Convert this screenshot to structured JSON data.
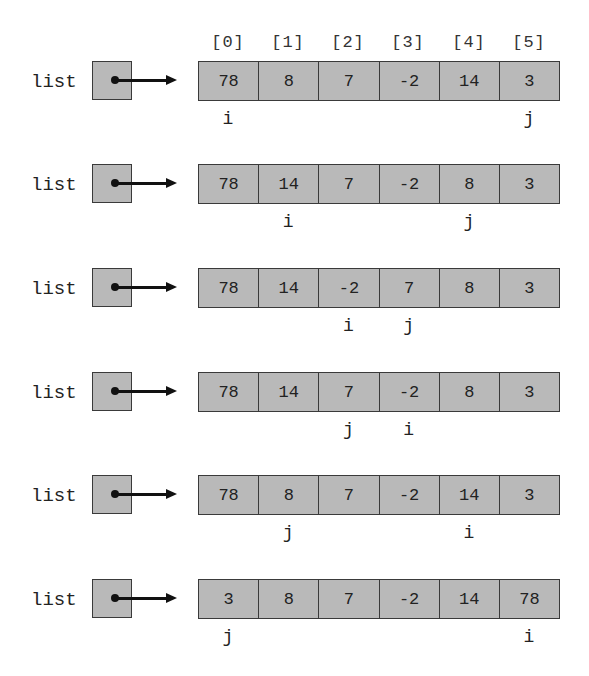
{
  "index_labels": [
    "[0]",
    "[1]",
    "[2]",
    "[3]",
    "[4]",
    "[5]"
  ],
  "variable_name": "list",
  "rows": [
    {
      "cells": [
        "78",
        "8",
        "7",
        "-2",
        "14",
        "3"
      ],
      "markers": [
        {
          "label": "i",
          "index": 0
        },
        {
          "label": "j",
          "index": 5
        }
      ]
    },
    {
      "cells": [
        "78",
        "14",
        "7",
        "-2",
        "8",
        "3"
      ],
      "markers": [
        {
          "label": "i",
          "index": 1
        },
        {
          "label": "j",
          "index": 4
        }
      ]
    },
    {
      "cells": [
        "78",
        "14",
        "-2",
        "7",
        "8",
        "3"
      ],
      "markers": [
        {
          "label": "i",
          "index": 2
        },
        {
          "label": "j",
          "index": 3
        }
      ]
    },
    {
      "cells": [
        "78",
        "14",
        "7",
        "-2",
        "8",
        "3"
      ],
      "markers": [
        {
          "label": "j",
          "index": 2
        },
        {
          "label": "i",
          "index": 3
        }
      ]
    },
    {
      "cells": [
        "78",
        "8",
        "7",
        "-2",
        "14",
        "3"
      ],
      "markers": [
        {
          "label": "j",
          "index": 1
        },
        {
          "label": "i",
          "index": 4
        }
      ]
    },
    {
      "cells": [
        "3",
        "8",
        "7",
        "-2",
        "14",
        "78"
      ],
      "markers": [
        {
          "label": "j",
          "index": 0
        },
        {
          "label": "i",
          "index": 5
        }
      ]
    }
  ],
  "colors": {
    "cell_fill": "#b9b9b9",
    "border": "#3a3a3a",
    "text": "#222222"
  }
}
